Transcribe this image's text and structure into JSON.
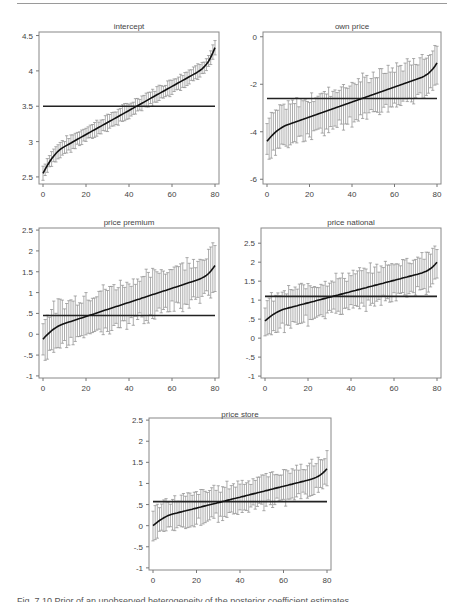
{
  "page": {
    "caption_partial": "Fig. 7.10  Prior of an unobserved heterogeneity of the posterior coefficient estimates"
  },
  "chart_data": [
    {
      "type": "line",
      "subtype": "sorted-estimates-with-error-bars",
      "title": "intercept",
      "xlabel": "",
      "ylabel": "",
      "xlim": [
        0,
        82
      ],
      "ylim": [
        2.4,
        4.55
      ],
      "xticks": [
        0,
        20,
        40,
        60,
        80
      ],
      "xtick_labels": [
        "0",
        "20",
        "40",
        "60",
        "80"
      ],
      "yticks": [
        2.5,
        3,
        3.5,
        4,
        4.5
      ],
      "ytick_labels": [
        "2.5",
        "3",
        "3.5",
        "4",
        "4.5"
      ],
      "reference_line": 3.5,
      "n": 81,
      "estimate_range": [
        2.55,
        4.33
      ],
      "halfwidth": 0.1,
      "curve_shape": "steep-start, linear middle, rising end",
      "grid": false
    },
    {
      "type": "line",
      "subtype": "sorted-estimates-with-error-bars",
      "title": "own price",
      "xlabel": "",
      "ylabel": "",
      "xlim": [
        0,
        82
      ],
      "ylim": [
        -6.2,
        0.2
      ],
      "xticks": [
        0,
        20,
        40,
        60,
        80
      ],
      "xtick_labels": [
        "0",
        "20",
        "40",
        "60",
        "80"
      ],
      "yticks": [
        -6,
        -4,
        -2,
        0
      ],
      "ytick_labels": [
        "-6",
        "-4",
        "-2",
        "0"
      ],
      "reference_line": -2.6,
      "n": 81,
      "estimate_range": [
        -4.4,
        -1.1
      ],
      "halfwidth": 0.8,
      "grid": false
    },
    {
      "type": "line",
      "subtype": "sorted-estimates-with-error-bars",
      "title": "price premium",
      "xlabel": "",
      "ylabel": "",
      "xlim": [
        0,
        82
      ],
      "ylim": [
        -1.05,
        2.55
      ],
      "xticks": [
        0,
        20,
        40,
        60,
        80
      ],
      "xtick_labels": [
        "0",
        "20",
        "40",
        "60",
        "80"
      ],
      "yticks": [
        -1,
        -0.5,
        0,
        0.5,
        1,
        1.5,
        2,
        2.5
      ],
      "ytick_labels": [
        "-1",
        "-.5",
        "0",
        ".5",
        "1",
        "1.5",
        "2",
        "2.5"
      ],
      "reference_line": 0.45,
      "n": 81,
      "estimate_range": [
        -0.12,
        1.65
      ],
      "halfwidth": 0.5,
      "grid": false
    },
    {
      "type": "line",
      "subtype": "sorted-estimates-with-error-bars",
      "title": "price national",
      "xlabel": "",
      "ylabel": "",
      "xlim": [
        0,
        82
      ],
      "ylim": [
        -1.05,
        2.9
      ],
      "xticks": [
        0,
        20,
        40,
        60,
        80
      ],
      "xtick_labels": [
        "0",
        "20",
        "40",
        "60",
        "80"
      ],
      "yticks": [
        -1,
        -0.5,
        0,
        0.5,
        1,
        1.5,
        2,
        2.5
      ],
      "ytick_labels": [
        "-1",
        "-.5",
        "0",
        ".5",
        "1",
        "1.5",
        "2",
        "2.5"
      ],
      "reference_line": 1.1,
      "n": 81,
      "estimate_range": [
        0.45,
        2.0
      ],
      "halfwidth": 0.45,
      "grid": false
    },
    {
      "type": "line",
      "subtype": "sorted-estimates-with-error-bars",
      "title": "price store",
      "xlabel": "",
      "ylabel": "",
      "xlim": [
        0,
        82
      ],
      "ylim": [
        -1.05,
        2.55
      ],
      "xticks": [
        0,
        20,
        40,
        60,
        80
      ],
      "xtick_labels": [
        "0",
        "20",
        "40",
        "60",
        "80"
      ],
      "yticks": [
        -1,
        -0.5,
        0,
        0.5,
        1,
        1.5,
        2,
        2.5
      ],
      "ytick_labels": [
        "-1",
        "-.5",
        "0",
        ".5",
        "1",
        "1.5",
        "2",
        "2.5"
      ],
      "reference_line": 0.57,
      "n": 81,
      "estimate_range": [
        0.0,
        1.35
      ],
      "halfwidth": 0.35,
      "grid": false
    }
  ]
}
